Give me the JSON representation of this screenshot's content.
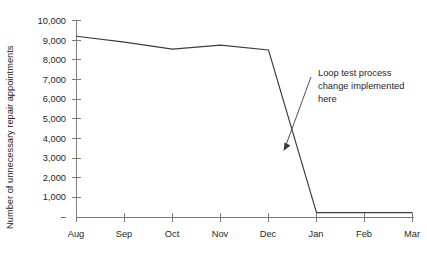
{
  "chart_data": {
    "type": "line",
    "title": "",
    "subtitle": "",
    "xlabel": "",
    "ylabel": "Number of unnecessary repair appointments",
    "categories": [
      "Aug",
      "Sep",
      "Oct",
      "Nov",
      "Dec",
      "Jan",
      "Feb",
      "Mar"
    ],
    "values": [
      9200,
      8900,
      8550,
      8750,
      8500,
      250,
      250,
      250
    ],
    "series": [
      {
        "name": "Unnecessary repair appointments",
        "values": [
          9200,
          8900,
          8550,
          8750,
          8500,
          250,
          250,
          250
        ]
      }
    ],
    "ylim": [
      0,
      10000
    ],
    "ytick_values": [
      0,
      1000,
      2000,
      3000,
      4000,
      5000,
      6000,
      7000,
      8000,
      9000,
      10000
    ],
    "ytick_labels": [
      "–",
      "1,000",
      "2,000",
      "3,000",
      "4,000",
      "5,000",
      "6,000",
      "7,000",
      "8,000",
      "9,000",
      "10,000"
    ],
    "xtick_labels": [
      "Aug",
      "Sep",
      "Oct",
      "Nov",
      "Dec",
      "Jan",
      "Feb",
      "Mar"
    ],
    "grid": false,
    "legend": false,
    "legend_position": "none",
    "line_color": "#3c3c3c",
    "axis_color": "#7b7b7b",
    "background_color": "#ffffff",
    "annotations": [
      {
        "text_lines": [
          "Loop test process",
          "change implemented",
          "here"
        ],
        "full_text": "Loop test process change implemented here",
        "target_category": "between Dec and Jan",
        "target_value": 3700
      }
    ]
  },
  "axis": {
    "y_title": "Number of unnecessary repair appointments"
  }
}
